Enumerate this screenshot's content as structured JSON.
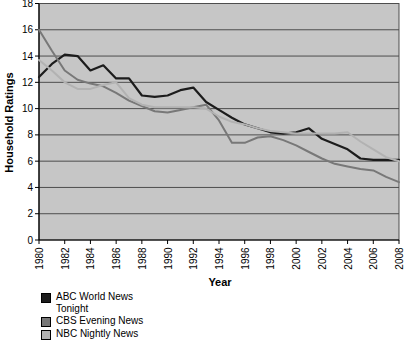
{
  "chart_data": {
    "type": "line",
    "title": "",
    "xlabel": "Year",
    "ylabel": "Household Ratings",
    "ylim": [
      0,
      18
    ],
    "grid": true,
    "legend_position": "bottom-left",
    "yticks": [
      0,
      2,
      4,
      6,
      8,
      10,
      12,
      14,
      16,
      18
    ],
    "xticks": [
      1980,
      1982,
      1984,
      1986,
      1988,
      1990,
      1992,
      1994,
      1996,
      1998,
      2000,
      2002,
      2004,
      2006,
      2008
    ],
    "x": [
      1980,
      1981,
      1982,
      1983,
      1984,
      1985,
      1986,
      1987,
      1988,
      1989,
      1990,
      1991,
      1992,
      1993,
      1994,
      1995,
      1996,
      1997,
      1998,
      1999,
      2000,
      2001,
      2002,
      2003,
      2004,
      2005,
      2006,
      2007,
      2008
    ],
    "series": [
      {
        "name": "ABC World News Tonight",
        "color": "#1c1c1c",
        "values": [
          12.4,
          13.4,
          14.1,
          14.0,
          12.9,
          13.3,
          12.3,
          12.3,
          11.0,
          10.9,
          11.0,
          11.4,
          11.6,
          10.5,
          9.9,
          9.3,
          8.8,
          8.5,
          8.2,
          8.1,
          8.2,
          8.5,
          7.7,
          7.3,
          6.9,
          6.2,
          6.1,
          6.1,
          6.1
        ]
      },
      {
        "name": "CBS Evening News",
        "color": "#787878",
        "values": [
          16.0,
          14.4,
          12.9,
          12.2,
          11.9,
          11.7,
          11.2,
          10.6,
          10.2,
          9.8,
          9.7,
          9.9,
          10.1,
          10.3,
          9.1,
          7.4,
          7.4,
          7.8,
          7.9,
          7.6,
          7.2,
          6.7,
          6.2,
          5.8,
          5.6,
          5.4,
          5.3,
          4.8,
          4.4
        ]
      },
      {
        "name": "NBC Nightly News",
        "color": "#b2b2b2",
        "values": [
          13.7,
          12.9,
          12.0,
          11.5,
          11.5,
          11.8,
          12.0,
          10.8,
          10.3,
          10.1,
          10.1,
          10.1,
          10.1,
          10.0,
          9.4,
          9.0,
          8.8,
          8.5,
          8.3,
          8.2,
          8.1,
          8.1,
          8.1,
          8.1,
          8.2,
          7.5,
          6.9,
          6.3,
          6.0
        ]
      }
    ],
    "colors": {
      "plot_background": "#c6c6c6",
      "gridline": "#4d4d4d",
      "axis": "#000000",
      "page_background": "#ffffff"
    }
  }
}
